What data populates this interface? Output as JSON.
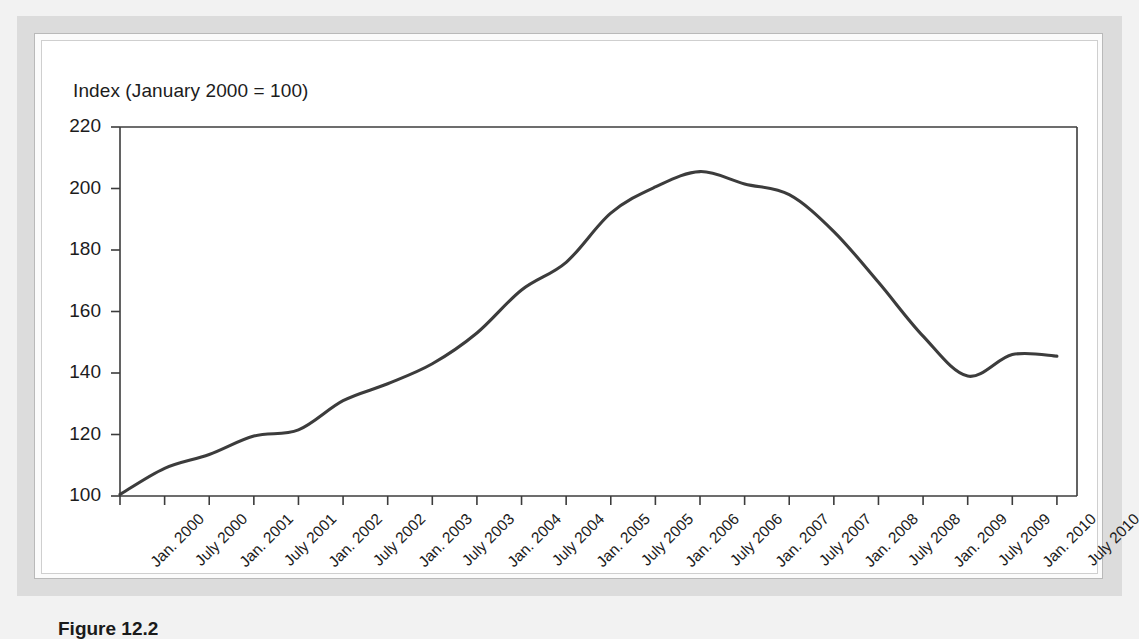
{
  "figure": {
    "caption": "Figure 12.2"
  },
  "chart_data": {
    "type": "line",
    "title": "",
    "axis_note": "Index (January 2000 = 100)",
    "xlabel": "",
    "ylabel": "Index (January 2000 = 100)",
    "ylim": [
      100,
      220
    ],
    "ytick_values": [
      220,
      200,
      180,
      160,
      140,
      120,
      100
    ],
    "grid": false,
    "legend": "none",
    "line_color": "#3c3c3c",
    "categories": [
      "Jan. 2000",
      "July 2000",
      "Jan. 2001",
      "July 2001",
      "Jan. 2002",
      "July 2002",
      "Jan. 2003",
      "July 2003",
      "Jan. 2004",
      "July 2004",
      "Jan. 2005",
      "July 2005",
      "Jan. 2006",
      "July 2006",
      "Jan. 2007",
      "July 2007",
      "Jan. 2008",
      "July 2008",
      "Jan. 2009",
      "July 2009",
      "Jan. 2010",
      "July 2010"
    ],
    "series": [
      {
        "name": "Index",
        "values": [
          100.5,
          109,
          113.5,
          119.5,
          121.5,
          131,
          136.5,
          143,
          153,
          167,
          176,
          192,
          200.5,
          205.5,
          201.5,
          198,
          186,
          169.5,
          152,
          139,
          146,
          145.5
        ]
      }
    ],
    "annotations": [
      {
        "label": "peak",
        "x": "July 2006",
        "y": 205.5
      },
      {
        "label": "trough",
        "x": "July 2009",
        "y": 139
      }
    ]
  }
}
